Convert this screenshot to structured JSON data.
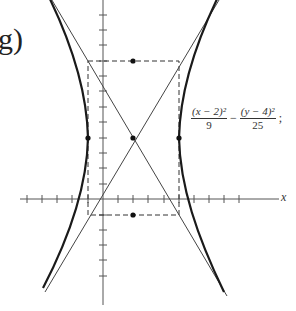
{
  "figure": {
    "label": "g)",
    "x_axis_label": "x",
    "equation": {
      "term1_numerator": "(x − 2)²",
      "term1_denominator": "9",
      "operator": "−",
      "term2_numerator": "(y − 4)²",
      "term2_denominator": "25",
      "equals": "= 1",
      "trailing": ";"
    },
    "center": [
      2,
      4
    ],
    "a": 3,
    "b": 5,
    "vertices": [
      [
        -1,
        4
      ],
      [
        5,
        4
      ]
    ],
    "co_vertices": [
      [
        2,
        9
      ],
      [
        2,
        -1
      ]
    ],
    "asymptotes": [
      "y - 4 = (5/3)(x - 2)",
      "y - 4 = -(5/3)(x - 2)"
    ],
    "reference_box": {
      "x": [
        -1,
        5
      ],
      "y": [
        -1,
        9
      ]
    },
    "colors": {
      "curve": "#1a1a1a",
      "asymptote": "#444444",
      "axis": "#555555",
      "dashed": "#333333"
    }
  }
}
